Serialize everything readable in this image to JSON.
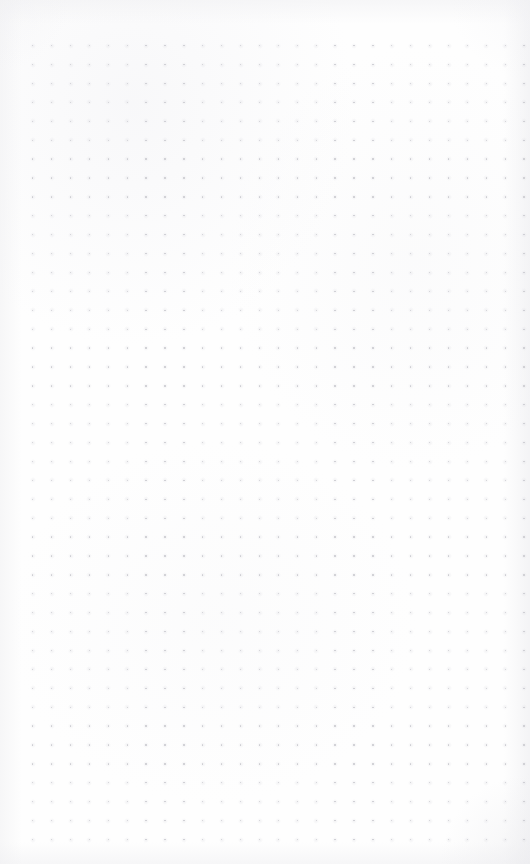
{
  "page": {
    "type": "dot-grid-paper",
    "width_px": 530,
    "height_px": 864,
    "content_text": "",
    "has_handwriting": false,
    "has_printed_text": false,
    "has_ui_chrome": false
  },
  "colors": {
    "paper_background": "#fefefe",
    "dot_color": "#c9c9ce",
    "dot_halo": "#d6d6dc",
    "edge_shade": "#f0f0f2"
  },
  "grid": {
    "columns": 27,
    "rows": 43,
    "spacing_px": 18.9,
    "origin_x_px": 32,
    "origin_y_px": 45,
    "dot_diameter_px": 1.4
  },
  "margins": {
    "left_px": 32,
    "top_px": 45,
    "right_px": 20,
    "bottom_px": 20
  }
}
